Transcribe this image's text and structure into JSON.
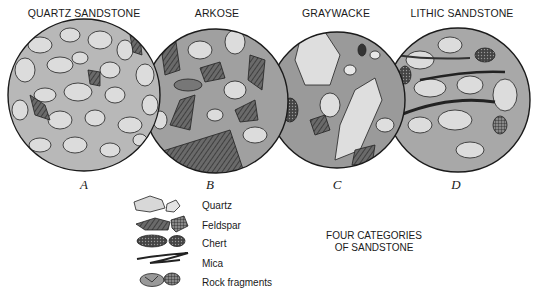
{
  "diagram": {
    "caption_line1": "FOUR CATEGORIES",
    "caption_line2": "OF SANDSTONE",
    "samples": [
      {
        "title": "QUARTZ SANDSTONE",
        "letter": "A"
      },
      {
        "title": "ARKOSE",
        "letter": "B"
      },
      {
        "title": "GRAYWACKE",
        "letter": "C"
      },
      {
        "title": "LITHIC SANDSTONE",
        "letter": "D"
      }
    ],
    "legend": [
      {
        "label": "Quartz",
        "icon": "quartz-grain-icon"
      },
      {
        "label": "Feldspar",
        "icon": "feldspar-grain-icon"
      },
      {
        "label": "Chert",
        "icon": "chert-grain-icon"
      },
      {
        "label": "Mica",
        "icon": "mica-flake-icon"
      },
      {
        "label": "Rock fragments",
        "icon": "rock-fragment-icon"
      }
    ],
    "colors": {
      "quartz": "#d8d8d8",
      "matrix": "#b0b0b0",
      "feldspar": "#555555",
      "chert": "#3a3a3a",
      "outline": "#1a1a1a"
    }
  }
}
